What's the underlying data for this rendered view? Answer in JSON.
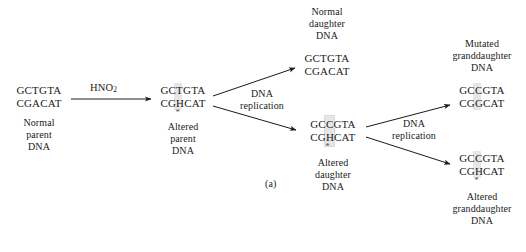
{
  "figure": {
    "panel_label": "(a)",
    "reagent_label": "HNO",
    "reagent_subscript": "2",
    "process_label_line1": "DNA",
    "process_label_line2": "replication"
  },
  "nodes": {
    "normal_parent": {
      "top_strand": "GCTGTA",
      "bottom_strand": "CGACAT",
      "caption_line1": "Normal",
      "caption_line2": "parent",
      "caption_line3": "DNA",
      "starred": false,
      "highlight_index": -1
    },
    "altered_parent": {
      "top_strand": "GCTGTA",
      "bottom_strand": "CGHCAT",
      "caption_line1": "Altered",
      "caption_line2": "parent",
      "caption_line3": "DNA",
      "starred": true,
      "highlight_index": 2
    },
    "normal_daughter": {
      "top_strand": "GCTGTA",
      "bottom_strand": "CGACAT",
      "caption_line1": "Normal",
      "caption_line2": "daughter",
      "caption_line3": "DNA",
      "starred": false,
      "highlight_index": -1
    },
    "altered_daughter": {
      "top_strand": "GCCGTA",
      "bottom_strand": "CGHCAT",
      "caption_line1": "Altered",
      "caption_line2": "daughter",
      "caption_line3": "DNA",
      "starred": true,
      "highlight_index": 2
    },
    "mutated_granddaughter": {
      "top_strand": "GCCGTA",
      "bottom_strand": "CGGCAT",
      "caption_line1": "Mutated",
      "caption_line2": "granddaughter",
      "caption_line3": "DNA",
      "starred": false,
      "highlight_index": 2
    },
    "altered_granddaughter": {
      "top_strand": "GCCGTA",
      "bottom_strand": "CGHCAT",
      "caption_line1": "Altered",
      "caption_line2": "granddaughter",
      "caption_line3": "DNA",
      "starred": true,
      "highlight_index": 2
    }
  },
  "colors": {
    "ink": "#1a1a1a",
    "highlight": "#d9d9d9",
    "background": "#ffffff"
  }
}
